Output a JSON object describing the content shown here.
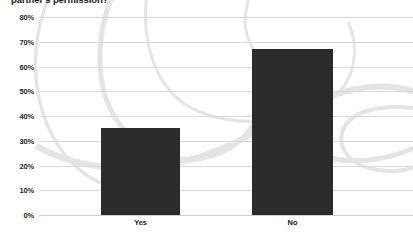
{
  "chart_data": {
    "type": "bar",
    "title": "partner's permission?",
    "xlabel": "",
    "ylabel": "",
    "categories": [
      "Yes",
      "No"
    ],
    "values": [
      35,
      67
    ],
    "series": [
      {
        "name": "Responses",
        "values": [
          35,
          67
        ]
      }
    ],
    "ylim": [
      0,
      80
    ],
    "ytick_labels": [
      "0%",
      "10%",
      "20%",
      "30%",
      "40%",
      "50%",
      "60%",
      "70%",
      "80%"
    ],
    "ytick_values": [
      0,
      10,
      20,
      30,
      40,
      50,
      60,
      70,
      80
    ],
    "grid": true,
    "legend": false,
    "legend_position": "none",
    "bar_color": "#2b2b2b",
    "gridline_color": "#d9d9d9",
    "background_color": "#ffffff",
    "decoration_color": "#e3e3e3",
    "annotations": []
  },
  "axis": {
    "ticks": [
      {
        "label": "80%",
        "value": 80
      },
      {
        "label": "70%",
        "value": 70
      },
      {
        "label": "60%",
        "value": 60
      },
      {
        "label": "50%",
        "value": 50
      },
      {
        "label": "40%",
        "value": 40
      },
      {
        "label": "30%",
        "value": 30
      },
      {
        "label": "20%",
        "value": 20
      },
      {
        "label": "10%",
        "value": 10
      },
      {
        "label": "0%",
        "value": 0
      }
    ]
  },
  "bars": [
    {
      "label": "Yes",
      "value": 35
    },
    {
      "label": "No",
      "value": 67
    }
  ]
}
